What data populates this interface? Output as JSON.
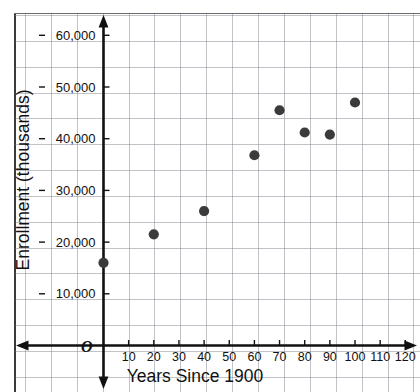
{
  "chart_data": {
    "type": "scatter",
    "title": "",
    "xlabel": "Years Since 1900",
    "ylabel": "Enrollment (thousands)",
    "origin_label": "O",
    "x": [
      0,
      20,
      40,
      60,
      70,
      80,
      90,
      100
    ],
    "values": [
      16000,
      21500,
      26000,
      36800,
      45500,
      41200,
      40800,
      47000
    ],
    "points": [
      {
        "x": 0,
        "y": 16000
      },
      {
        "x": 20,
        "y": 21500
      },
      {
        "x": 40,
        "y": 26000
      },
      {
        "x": 60,
        "y": 36800
      },
      {
        "x": 70,
        "y": 45500
      },
      {
        "x": 80,
        "y": 41200
      },
      {
        "x": 90,
        "y": 40800
      },
      {
        "x": 100,
        "y": 47000
      }
    ],
    "xlim": [
      0,
      125
    ],
    "ylim": [
      0,
      66000
    ],
    "xticks": [
      10,
      20,
      30,
      40,
      50,
      60,
      70,
      80,
      90,
      100,
      110,
      120
    ],
    "xticklabels": [
      "10",
      "20",
      "30",
      "40",
      "50",
      "60",
      "70",
      "80",
      "90",
      "100",
      "110",
      "120"
    ],
    "yticks": [
      10000,
      20000,
      30000,
      40000,
      50000,
      60000
    ],
    "yticklabels": [
      "10,000",
      "20,000",
      "30,000",
      "40,000",
      "50,000",
      "60,000"
    ],
    "grid": true,
    "legend": null,
    "marker_color": "#3b3b3b",
    "axis_color": "#111111",
    "grid_color": "#7878874D",
    "background": "#ffffff"
  }
}
